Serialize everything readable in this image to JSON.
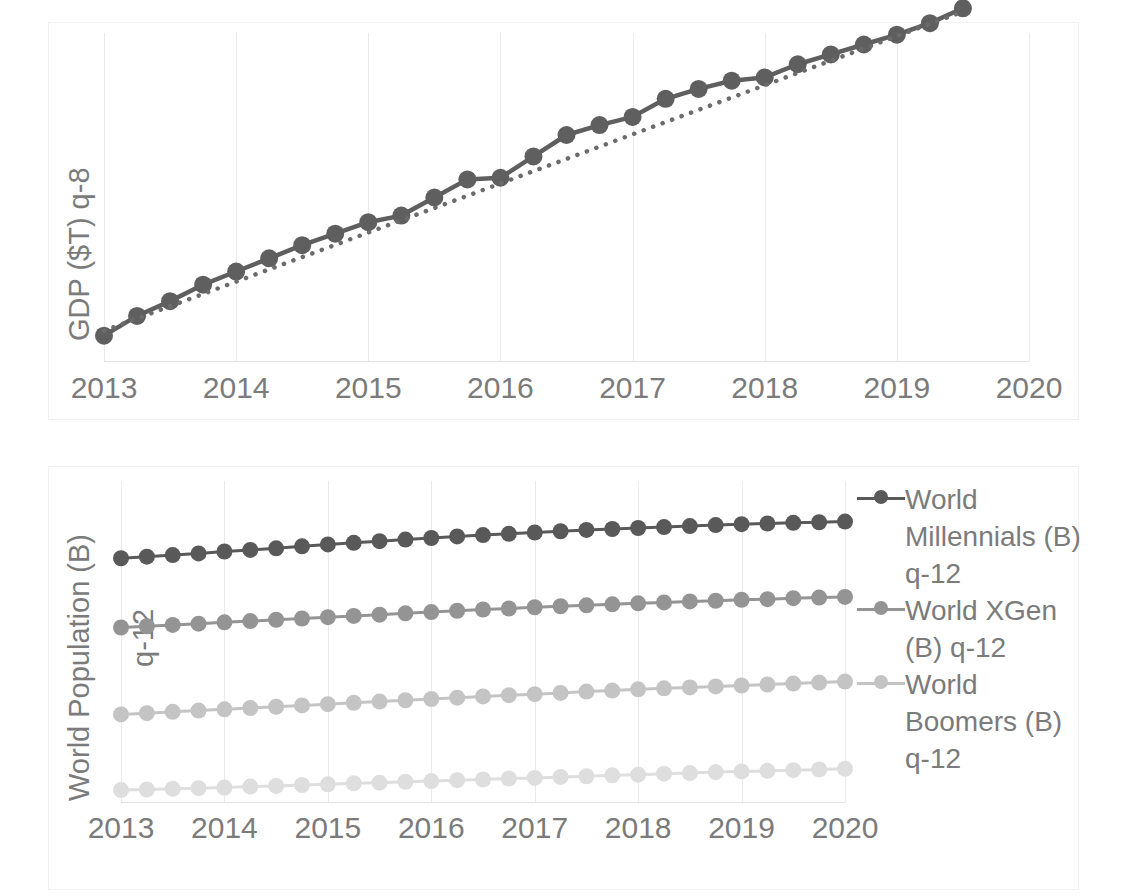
{
  "chart_data": [
    {
      "id": "gdp",
      "type": "line",
      "title": "",
      "ylabel": "GDP ($T) q-8",
      "xlabel": "",
      "xticklabels": [
        "2013",
        "2014",
        "2015",
        "2016",
        "2017",
        "2018",
        "2019",
        "2020"
      ],
      "xlim": [
        2013,
        2020
      ],
      "ylim": [
        0,
        1
      ],
      "grid": "vertical",
      "legend_position": "none",
      "series": [
        {
          "name": "GDP ($T) q-8",
          "color": "#5f5f5f",
          "style": "solid-with-markers",
          "x": [
            2013.0,
            2013.25,
            2013.5,
            2013.75,
            2014.0,
            2014.25,
            2014.5,
            2014.75,
            2015.0,
            2015.25,
            2015.5,
            2015.75,
            2016.0,
            2016.25,
            2016.5,
            2016.75,
            2017.0,
            2017.25,
            2017.5,
            2017.75,
            2018.0,
            2018.25,
            2018.5,
            2018.75,
            2019.0,
            2019.25,
            2019.5
          ],
          "values": [
            0.08,
            0.14,
            0.185,
            0.235,
            0.275,
            0.315,
            0.355,
            0.39,
            0.425,
            0.445,
            0.5,
            0.555,
            0.56,
            0.625,
            0.69,
            0.72,
            0.745,
            0.8,
            0.83,
            0.855,
            0.865,
            0.905,
            0.935,
            0.965,
            0.995,
            1.03,
            1.075
          ]
        },
        {
          "name": "GDP trend (dotted)",
          "color": "#6b6b6b",
          "style": "dotted",
          "x": [
            2013.0,
            2019.5
          ],
          "values": [
            0.095,
            1.065
          ]
        }
      ]
    },
    {
      "id": "population",
      "type": "line",
      "title": "",
      "ylabel": "World Population (B)",
      "ylabel_second_line": "q-12",
      "xlabel": "",
      "xticklabels": [
        "2013",
        "2014",
        "2015",
        "2016",
        "2017",
        "2018",
        "2019",
        "2020"
      ],
      "xlim": [
        2013,
        2020
      ],
      "ylim": [
        0,
        1
      ],
      "grid": "vertical",
      "legend_position": "right",
      "series": [
        {
          "name": "World Millennials (B) q-12",
          "color": "#595959",
          "style": "solid-with-markers",
          "x": [
            2013.0,
            2013.25,
            2013.5,
            2013.75,
            2014.0,
            2014.25,
            2014.5,
            2014.75,
            2015.0,
            2015.25,
            2015.5,
            2015.75,
            2016.0,
            2016.25,
            2016.5,
            2016.75,
            2017.0,
            2017.25,
            2017.5,
            2017.75,
            2018.0,
            2018.25,
            2018.5,
            2018.75,
            2019.0,
            2019.25,
            2019.5,
            2019.75,
            2020.0
          ],
          "values": [
            0.76,
            0.765,
            0.77,
            0.775,
            0.781,
            0.786,
            0.791,
            0.797,
            0.803,
            0.808,
            0.813,
            0.818,
            0.823,
            0.828,
            0.832,
            0.836,
            0.84,
            0.844,
            0.848,
            0.851,
            0.854,
            0.857,
            0.86,
            0.863,
            0.866,
            0.868,
            0.87,
            0.872,
            0.874
          ]
        },
        {
          "name": "World XGen (B) q-12",
          "color": "#949494",
          "style": "solid-with-markers",
          "x": [
            2013.0,
            2013.25,
            2013.5,
            2013.75,
            2014.0,
            2014.25,
            2014.5,
            2014.75,
            2015.0,
            2015.25,
            2015.5,
            2015.75,
            2016.0,
            2016.25,
            2016.5,
            2016.75,
            2017.0,
            2017.25,
            2017.5,
            2017.75,
            2018.0,
            2018.25,
            2018.5,
            2018.75,
            2019.0,
            2019.25,
            2019.5,
            2019.75,
            2020.0
          ],
          "values": [
            0.545,
            0.549,
            0.553,
            0.557,
            0.561,
            0.565,
            0.569,
            0.573,
            0.577,
            0.581,
            0.585,
            0.589,
            0.593,
            0.597,
            0.601,
            0.604,
            0.608,
            0.611,
            0.614,
            0.617,
            0.62,
            0.623,
            0.626,
            0.628,
            0.631,
            0.633,
            0.636,
            0.638,
            0.64
          ]
        },
        {
          "name": "World Boomers (B) q-12",
          "color": "#c4c4c4",
          "style": "solid-with-markers",
          "x": [
            2013.0,
            2013.25,
            2013.5,
            2013.75,
            2014.0,
            2014.25,
            2014.5,
            2014.75,
            2015.0,
            2015.25,
            2015.5,
            2015.75,
            2016.0,
            2016.25,
            2016.5,
            2016.75,
            2017.0,
            2017.25,
            2017.5,
            2017.75,
            2018.0,
            2018.25,
            2018.5,
            2018.75,
            2019.0,
            2019.25,
            2019.5,
            2019.75,
            2020.0
          ],
          "values": [
            0.275,
            0.279,
            0.283,
            0.287,
            0.291,
            0.295,
            0.299,
            0.303,
            0.307,
            0.311,
            0.315,
            0.319,
            0.323,
            0.327,
            0.331,
            0.335,
            0.338,
            0.342,
            0.346,
            0.349,
            0.353,
            0.356,
            0.359,
            0.362,
            0.365,
            0.368,
            0.371,
            0.374,
            0.377
          ]
        },
        {
          "name": "World Silent (B) q-12",
          "color": "#dedede",
          "style": "solid-with-markers",
          "x": [
            2013.0,
            2013.25,
            2013.5,
            2013.75,
            2014.0,
            2014.25,
            2014.5,
            2014.75,
            2015.0,
            2015.25,
            2015.5,
            2015.75,
            2016.0,
            2016.25,
            2016.5,
            2016.75,
            2017.0,
            2017.25,
            2017.5,
            2017.75,
            2018.0,
            2018.25,
            2018.5,
            2018.75,
            2019.0,
            2019.25,
            2019.5,
            2019.75,
            2020.0
          ],
          "values": [
            0.04,
            0.042,
            0.044,
            0.046,
            0.048,
            0.051,
            0.053,
            0.056,
            0.058,
            0.061,
            0.063,
            0.066,
            0.068,
            0.071,
            0.073,
            0.076,
            0.078,
            0.081,
            0.083,
            0.086,
            0.088,
            0.091,
            0.093,
            0.096,
            0.098,
            0.1,
            0.102,
            0.104,
            0.106
          ]
        }
      ],
      "legend": [
        {
          "label": "World Millennials (B) q-12",
          "color": "#595959"
        },
        {
          "label": "World XGen (B) q-12",
          "color": "#949494"
        },
        {
          "label": "World Boomers (B) q-12",
          "color": "#c4c4c4"
        }
      ]
    }
  ],
  "colors": {
    "grid": "#eaeaea",
    "axis": "#e2e2e2",
    "frame": "#f1f1f1",
    "text": "#7b7b7b",
    "series1": "#595959",
    "series2": "#949494",
    "series3": "#c4c4c4",
    "series4": "#dedede",
    "gdp_line": "#5f5f5f"
  }
}
